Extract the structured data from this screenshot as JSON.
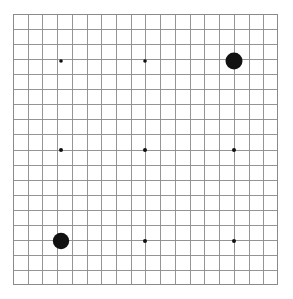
{
  "figure": {
    "type": "scatter-on-grid",
    "title": "",
    "background_color": "#ffffff",
    "canvas_width": 293,
    "canvas_height": 299
  },
  "grid": {
    "name": "graph-paper-grid",
    "origin_x": 13,
    "origin_y": 14,
    "width": 265,
    "height": 271,
    "columns": 18,
    "rows": 18,
    "cell_width": 14.72,
    "cell_height": 15.06,
    "minor_line_color": "#c8c8c8",
    "major_line_color": "#8a8a8a",
    "border_color": "#8a8a8a",
    "border_width": 1,
    "minor_line_width": 0.6,
    "major_line_width": 0.9,
    "major_every": 1,
    "show_grid": true
  },
  "chart_data": {
    "type": "scatter",
    "title": "",
    "xlabel": "",
    "ylabel": "",
    "xlim": [
      0,
      18
    ],
    "ylim": [
      0,
      18
    ],
    "grid": true,
    "legend": null,
    "marker_color": "#111111",
    "points": [
      {
        "label": "p1",
        "x": 3,
        "y": 3,
        "px": 61,
        "py": 61,
        "radius": 1.8,
        "size": "small"
      },
      {
        "label": "p2",
        "x": 9,
        "y": 3,
        "px": 145,
        "py": 61,
        "radius": 1.8,
        "size": "small"
      },
      {
        "label": "p3",
        "x": 15,
        "y": 3,
        "px": 234,
        "py": 61,
        "radius": 8.5,
        "size": "large"
      },
      {
        "label": "p4",
        "x": 3,
        "y": 9,
        "px": 61,
        "py": 150,
        "radius": 2.0,
        "size": "small"
      },
      {
        "label": "p5",
        "x": 9,
        "y": 9,
        "px": 145,
        "py": 150,
        "radius": 2.0,
        "size": "small"
      },
      {
        "label": "p6",
        "x": 15,
        "y": 9,
        "px": 234,
        "py": 150,
        "radius": 2.0,
        "size": "small"
      },
      {
        "label": "p7",
        "x": 3,
        "y": 15,
        "px": 61,
        "py": 241,
        "radius": 8.2,
        "size": "large"
      },
      {
        "label": "p8",
        "x": 9,
        "y": 15,
        "px": 145,
        "py": 241,
        "radius": 2.0,
        "size": "small"
      },
      {
        "label": "p9",
        "x": 15,
        "y": 15,
        "px": 234,
        "py": 241,
        "radius": 2.0,
        "size": "small"
      }
    ]
  }
}
